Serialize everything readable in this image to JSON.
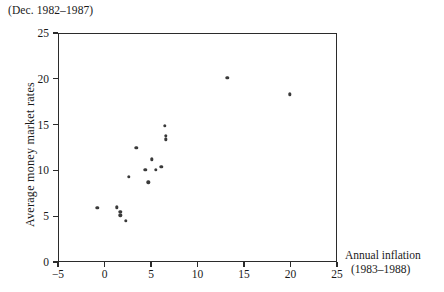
{
  "chart_data": {
    "type": "scatter",
    "title": "(Dec. 1982–1987)",
    "xlabel": "Annual inflation",
    "xlabel_line2": "(1983–1988)",
    "ylabel": "Average money market rates",
    "xlim": [
      -5,
      25
    ],
    "ylim": [
      0,
      25
    ],
    "xticks": [
      -5,
      0,
      5,
      10,
      15,
      20,
      25
    ],
    "xticklabels": [
      "−5",
      "0",
      "5",
      "10",
      "15",
      "20",
      "25"
    ],
    "yticks": [
      0,
      5,
      10,
      15,
      20,
      25
    ],
    "yticklabels": [
      "0",
      "5",
      "10",
      "15",
      "20",
      "25"
    ],
    "grid": false,
    "legend": null,
    "marker": "filled-circle",
    "marker_color": "#3a3a3a",
    "points": [
      {
        "x": -0.9,
        "y": 6.0
      },
      {
        "x": 1.2,
        "y": 6.1
      },
      {
        "x": 1.6,
        "y": 5.6
      },
      {
        "x": 1.6,
        "y": 5.2
      },
      {
        "x": 2.2,
        "y": 4.6
      },
      {
        "x": 2.5,
        "y": 9.4
      },
      {
        "x": 3.3,
        "y": 12.6
      },
      {
        "x": 4.3,
        "y": 10.2
      },
      {
        "x": 4.6,
        "y": 8.8
      },
      {
        "x": 5.0,
        "y": 11.3
      },
      {
        "x": 5.4,
        "y": 10.2
      },
      {
        "x": 6.0,
        "y": 10.5
      },
      {
        "x": 6.4,
        "y": 15.0
      },
      {
        "x": 6.5,
        "y": 13.9
      },
      {
        "x": 6.5,
        "y": 13.5
      },
      {
        "x": 13.1,
        "y": 20.2
      },
      {
        "x": 19.8,
        "y": 18.4
      }
    ]
  }
}
